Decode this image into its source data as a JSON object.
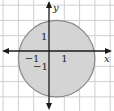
{
  "chart_data": {
    "type": "area",
    "title": "",
    "xlabel": "x",
    "ylabel": "y",
    "xlim": [
      -3,
      4
    ],
    "ylim": [
      -3,
      3
    ],
    "grid": true,
    "grid_spacing": 1,
    "tick_labels": {
      "x": [
        {
          "value": -1,
          "label": "−1"
        },
        {
          "value": 1,
          "label": "1"
        }
      ],
      "y": [
        {
          "value": 1,
          "label": "1"
        },
        {
          "value": -1,
          "label": "−1"
        }
      ]
    },
    "shapes": [
      {
        "kind": "circle",
        "center": [
          0.5,
          -0.5
        ],
        "radius": 2.5,
        "fill": "#d4d4d4",
        "stroke": "#888888",
        "filled": true
      }
    ],
    "legend": null
  },
  "colors": {
    "grid": "#cfcfcf",
    "axis": "#1a1a1a",
    "fill": "#d4d4d4",
    "stroke": "#888888",
    "background": "#ffffff"
  }
}
